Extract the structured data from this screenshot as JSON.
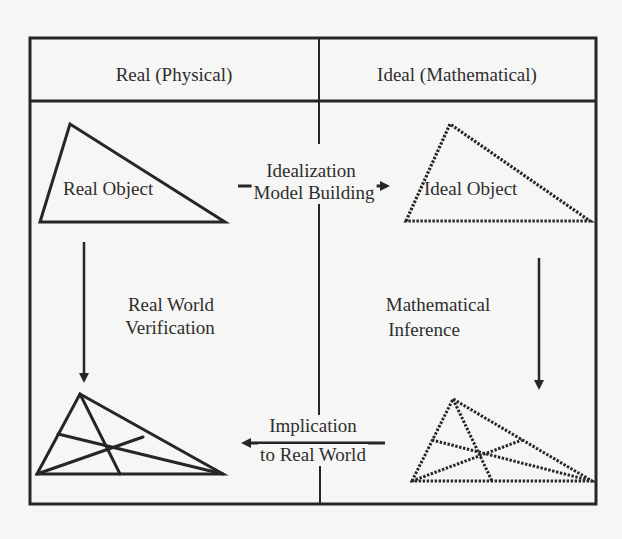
{
  "diagram": {
    "type": "modeling-cycle",
    "columns": {
      "left_header": "Real (Physical)",
      "right_header": "Ideal (Mathematical)"
    },
    "nodes": {
      "real_object": "Real Object",
      "ideal_object": "Ideal Object",
      "real_result": "",
      "ideal_result": ""
    },
    "arrows": {
      "idealization": {
        "line1": "Idealization",
        "line2": "Model Building",
        "direction": "right"
      },
      "mathematical_inference": {
        "line1": "Mathematical",
        "line2": "Inference",
        "direction": "down"
      },
      "implication": {
        "line1": "Implication",
        "line2": "to Real World",
        "direction": "left"
      },
      "verification": {
        "line1": "Real World",
        "line2": "Verification",
        "direction": "down"
      }
    },
    "styles": {
      "line_color": "#262626",
      "background": "#f6f6f5"
    }
  }
}
